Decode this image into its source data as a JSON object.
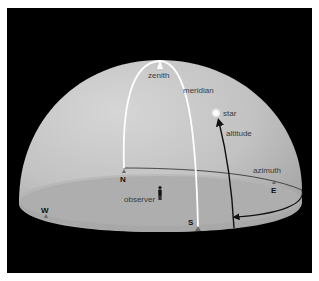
{
  "diagram": {
    "type": "celestial-sphere-horizon-system",
    "colors": {
      "background": "#000000",
      "dome": "#bdbdbd",
      "ground": "#a9a9a9",
      "meridian": "#ffffff",
      "lines": "#1a1a1a"
    },
    "labels": {
      "zenith": "zenith",
      "meridian": "meridian",
      "star": "star",
      "altitude": "altitude",
      "azimuth": "azimuth",
      "observer": "observer"
    },
    "directions": {
      "north": "N",
      "south": "S",
      "east": "E",
      "west": "W"
    }
  }
}
